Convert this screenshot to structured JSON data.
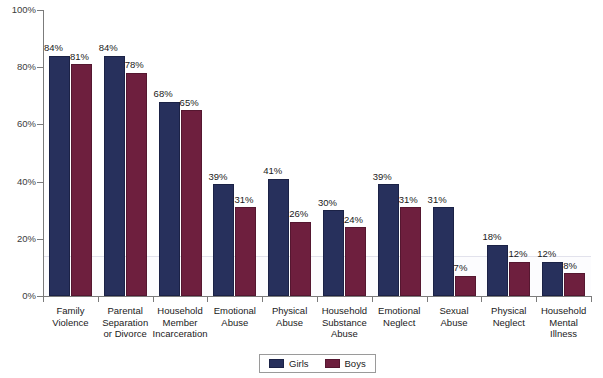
{
  "chart_data": {
    "type": "bar",
    "title": "",
    "xlabel": "",
    "ylabel": "",
    "ylim": [
      0,
      100
    ],
    "ytick_labels": [
      "0%",
      "20%",
      "40%",
      "60%",
      "80%",
      "100%"
    ],
    "ytick_values": [
      0,
      20,
      40,
      60,
      80,
      100
    ],
    "grid": false,
    "legend_position": "bottom-center",
    "reference_line": 14,
    "categories": [
      "Family Violence",
      "Parental Separation or Divorce",
      "Household Member Incarceration",
      "Emotional Abuse",
      "Physical Abuse",
      "Household Substance Abuse",
      "Emotional Neglect",
      "Sexual Abuse",
      "Physical Neglect",
      "Household Mental Illness"
    ],
    "category_lines": [
      [
        "Family",
        "Violence"
      ],
      [
        "Parental",
        "Separation",
        "or Divorce"
      ],
      [
        "Household",
        "Member",
        "Incarceration"
      ],
      [
        "Emotional",
        "Abuse"
      ],
      [
        "Physical",
        "Abuse"
      ],
      [
        "Household",
        "Substance",
        "Abuse"
      ],
      [
        "Emotional",
        "Neglect"
      ],
      [
        "Sexual",
        "Abuse"
      ],
      [
        "Physical",
        "Neglect"
      ],
      [
        "Household",
        "Mental",
        "Illness"
      ]
    ],
    "series": [
      {
        "name": "Girls",
        "color": "#27305c",
        "values": [
          84,
          84,
          68,
          39,
          41,
          30,
          39,
          31,
          18,
          12
        ],
        "labels": [
          "84%",
          "84%",
          "68%",
          "39%",
          "41%",
          "30%",
          "39%",
          "31%",
          "18%",
          "12%"
        ]
      },
      {
        "name": "Boys",
        "color": "#6e1f3e",
        "values": [
          81,
          78,
          65,
          31,
          26,
          24,
          31,
          7,
          12,
          8
        ],
        "labels": [
          "81%",
          "78%",
          "65%",
          "31%",
          "26%",
          "24%",
          "31%",
          "7%",
          "12%",
          "8%"
        ]
      }
    ]
  },
  "legend": {
    "items": [
      {
        "label": "Girls",
        "color": "#27305c"
      },
      {
        "label": "Boys",
        "color": "#6e1f3e"
      }
    ]
  }
}
